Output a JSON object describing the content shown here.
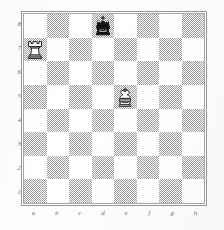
{
  "diagram": {
    "type": "chess-board-diagram",
    "orientation": "white-bottom",
    "files": [
      "a",
      "b",
      "c",
      "d",
      "e",
      "f",
      "g",
      "h"
    ],
    "ranks": [
      "8",
      "7",
      "6",
      "5",
      "4",
      "3",
      "2",
      "1"
    ],
    "colors": {
      "light_square": "#ffffff",
      "dark_square": "#9d9d9d",
      "frame": "#9a9a9a",
      "coordinate_text": "#6d6d6d",
      "white_piece_fill": "#ffffff",
      "white_piece_outline": "#2b2b2b",
      "black_piece_fill": "#1d1d1d"
    },
    "pieces": [
      {
        "square": "d8",
        "color": "black",
        "type": "king",
        "glyph": "♚",
        "name": "black-king"
      },
      {
        "square": "a7",
        "color": "white",
        "type": "rook",
        "glyph": "♖",
        "name": "white-rook"
      },
      {
        "square": "e5",
        "color": "white",
        "type": "king",
        "glyph": "♔",
        "name": "white-king"
      }
    ],
    "position_fen": "3k4/R7/8/4K3/8/8/8/8",
    "squares": [
      [
        "light",
        "dark",
        "light",
        "dark",
        "light",
        "dark",
        "light",
        "dark"
      ],
      [
        "dark",
        "light",
        "dark",
        "light",
        "dark",
        "light",
        "dark",
        "light"
      ],
      [
        "light",
        "dark",
        "light",
        "dark",
        "light",
        "dark",
        "light",
        "dark"
      ],
      [
        "dark",
        "light",
        "dark",
        "light",
        "dark",
        "light",
        "dark",
        "light"
      ],
      [
        "light",
        "dark",
        "light",
        "dark",
        "light",
        "dark",
        "light",
        "dark"
      ],
      [
        "dark",
        "light",
        "dark",
        "light",
        "dark",
        "light",
        "dark",
        "light"
      ],
      [
        "light",
        "dark",
        "light",
        "dark",
        "light",
        "dark",
        "light",
        "dark"
      ],
      [
        "dark",
        "light",
        "dark",
        "light",
        "dark",
        "light",
        "dark",
        "light"
      ]
    ]
  }
}
